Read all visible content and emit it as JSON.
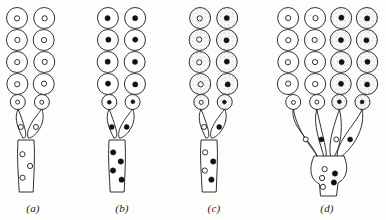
{
  "figure": {
    "background_color": "#fdfdfc",
    "ink_color": "#1b1b1b",
    "stipple_color": "#b9b9b9",
    "fill_white": "#ffffff",
    "dot_filled_color": "#111111",
    "width": 386,
    "height": 220
  },
  "panels": [
    {
      "id": "a",
      "label": "(a)",
      "label_x": 33,
      "label_y": 202,
      "column_count": 2,
      "columns": [
        {
          "cx": 17,
          "shaded": false,
          "nucleus": "open"
        },
        {
          "cx": 44,
          "shaded": false,
          "nucleus": "open"
        }
      ],
      "cells_per_column": 5,
      "stalk": {
        "x": 18,
        "top": 140,
        "bottom": 192,
        "width": 16,
        "dots": "open",
        "dot_count": 3
      },
      "neck_cells": 2,
      "neck_dots": "open"
    },
    {
      "id": "b",
      "label": "(b)",
      "label_x": 122,
      "label_y": 202,
      "column_count": 2,
      "columns": [
        {
          "cx": 108,
          "shaded": false,
          "nucleus": "filled"
        },
        {
          "cx": 135,
          "shaded": false,
          "nucleus": "filled"
        }
      ],
      "cells_per_column": 5,
      "stalk": {
        "x": 109,
        "top": 140,
        "bottom": 192,
        "width": 16,
        "dots": "filled",
        "dot_count": 4
      },
      "neck_cells": 2,
      "neck_dots": "filled"
    },
    {
      "id": "c",
      "label": "(c)",
      "label_x": 214,
      "label_y": 202,
      "column_count": 2,
      "columns": [
        {
          "cx": 200,
          "shaded": true,
          "nucleus": "open"
        },
        {
          "cx": 227,
          "shaded": true,
          "nucleus": "filled"
        }
      ],
      "cells_per_column": 5,
      "stalk": {
        "x": 201,
        "top": 140,
        "bottom": 192,
        "width": 16,
        "dots": "mixed",
        "dot_count": 4
      },
      "neck_cells": 2,
      "neck_dots": "mixed"
    },
    {
      "id": "d",
      "label": "(d)",
      "label_x": 327,
      "label_y": 202,
      "column_count": 4,
      "columns": [
        {
          "cx": 288,
          "shaded": false,
          "nucleus": "open"
        },
        {
          "cx": 315,
          "shaded": false,
          "nucleus": "open"
        },
        {
          "cx": 341,
          "shaded": true,
          "nucleus": "filled"
        },
        {
          "cx": 367,
          "shaded": true,
          "nucleus": "filled"
        }
      ],
      "cells_per_column": 5,
      "stalk": {
        "x": 316,
        "top": 160,
        "bottom": 196,
        "width": 26,
        "dots": "mixed",
        "dot_count": 5
      },
      "neck_cells": 4,
      "neck_dots": "mixed"
    }
  ],
  "geometry": {
    "cell_radius": 10.5,
    "cell_radius_small": 7.5,
    "nucleus_radius": 2.6,
    "nucleus_radius_small": 2.0,
    "row_y": [
      18,
      40,
      62,
      84,
      102
    ],
    "line_width": 0.9
  }
}
